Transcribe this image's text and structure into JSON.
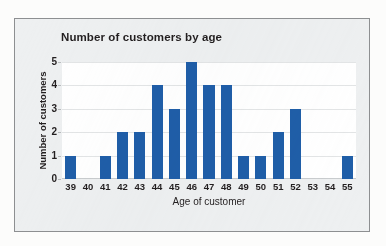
{
  "chart_data": {
    "type": "bar",
    "title": "Number of customers by age",
    "xlabel": "Age of customer",
    "ylabel": "Number of customers",
    "categories": [
      "39",
      "40",
      "41",
      "42",
      "43",
      "44",
      "45",
      "46",
      "47",
      "48",
      "49",
      "50",
      "51",
      "52",
      "53",
      "54",
      "55"
    ],
    "values": [
      1,
      0,
      1,
      2,
      2,
      4,
      3,
      5,
      4,
      4,
      1,
      1,
      2,
      3,
      0,
      0,
      1
    ],
    "ylim": [
      0,
      5
    ],
    "yticks": [
      "0",
      "1",
      "2",
      "3",
      "4",
      "5"
    ],
    "grid": true,
    "legend": "none",
    "bar_color": "#1F5EA8",
    "plot_background": "#FFFFFF",
    "frame_background": "#EEF0F1",
    "gridline_color": "#E3E5E6",
    "text_color": "#231F20"
  }
}
